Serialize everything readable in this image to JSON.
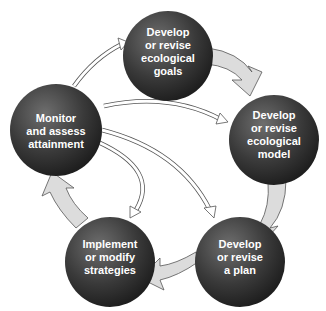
{
  "diagram": {
    "type": "cycle",
    "colors": {
      "circle_light": "#6a6a6a",
      "circle_dark": "#2a2a2a",
      "arrow_fill": "#dcdcdc",
      "arrow_stroke": "#555555",
      "text": "#ffffff"
    },
    "nodes": [
      {
        "id": "goals",
        "lines": [
          "Develop",
          "or revise",
          "ecological",
          "goals"
        ]
      },
      {
        "id": "model",
        "lines": [
          "Develop",
          "or revise",
          "ecological",
          "model"
        ]
      },
      {
        "id": "plan",
        "lines": [
          "Develop",
          "or revise",
          "a plan"
        ]
      },
      {
        "id": "strategies",
        "lines": [
          "Implement",
          "or modify",
          "strategies"
        ]
      },
      {
        "id": "monitor",
        "lines": [
          "Monitor",
          "and assess",
          "attainment"
        ]
      }
    ],
    "cycle_arrows": [
      {
        "from": "goals",
        "to": "model"
      },
      {
        "from": "model",
        "to": "plan"
      },
      {
        "from": "plan",
        "to": "strategies"
      },
      {
        "from": "strategies",
        "to": "monitor"
      }
    ],
    "feedback_arrows": [
      {
        "from": "monitor",
        "to": "goals"
      },
      {
        "from": "monitor",
        "to": "model"
      },
      {
        "from": "monitor",
        "to": "plan"
      },
      {
        "from": "monitor",
        "to": "strategies"
      }
    ]
  }
}
